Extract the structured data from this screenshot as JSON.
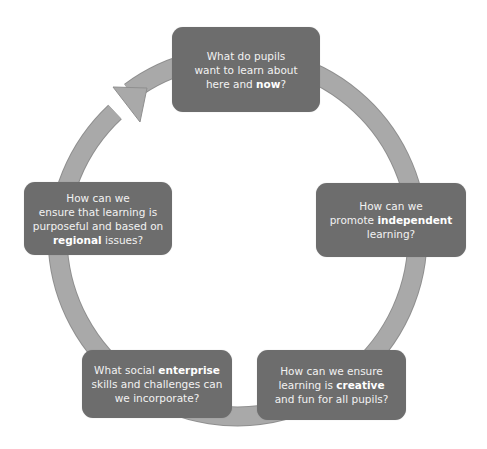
{
  "diagram": {
    "type": "cycle",
    "colors": {
      "box_fill": "#6d6d6d",
      "box_text": "#f2f2f2",
      "ring_fill": "#a9a9a9",
      "ring_edge": "#8f8f8f",
      "background": "#ffffff"
    },
    "nodes": [
      {
        "id": "top",
        "lines": [
          {
            "pre": "What do pupils",
            "bold": "",
            "post": ""
          },
          {
            "pre": "want to learn about",
            "bold": "",
            "post": ""
          },
          {
            "pre": "here and ",
            "bold": "now",
            "post": "?"
          }
        ]
      },
      {
        "id": "right",
        "lines": [
          {
            "pre": "How can we",
            "bold": "",
            "post": ""
          },
          {
            "pre": "promote ",
            "bold": "independent",
            "post": ""
          },
          {
            "pre": "learning?",
            "bold": "",
            "post": ""
          }
        ]
      },
      {
        "id": "bottom-right",
        "lines": [
          {
            "pre": "How can we ensure",
            "bold": "",
            "post": ""
          },
          {
            "pre": "learning is ",
            "bold": "creative",
            "post": ""
          },
          {
            "pre": "and fun for all pupils?",
            "bold": "",
            "post": ""
          }
        ]
      },
      {
        "id": "bottom-left",
        "lines": [
          {
            "pre": "What social ",
            "bold": "enterprise",
            "post": ""
          },
          {
            "pre": "skills and challenges can",
            "bold": "",
            "post": ""
          },
          {
            "pre": "we incorporate?",
            "bold": "",
            "post": ""
          }
        ]
      },
      {
        "id": "left",
        "lines": [
          {
            "pre": "How can we",
            "bold": "",
            "post": ""
          },
          {
            "pre": "ensure that learning is",
            "bold": "",
            "post": ""
          },
          {
            "pre": "purposeful and based on",
            "bold": "",
            "post": ""
          },
          {
            "pre": "",
            "bold": "regional",
            "post": " issues?"
          }
        ]
      }
    ],
    "arrow": {
      "direction": "clockwise",
      "head_position": "upper-left, pointing toward top node"
    }
  }
}
